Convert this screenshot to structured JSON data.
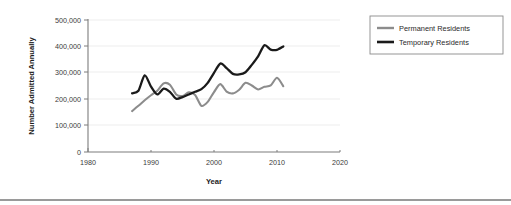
{
  "chart_data": {
    "type": "line",
    "title": "",
    "xlabel": "Year",
    "ylabel": "Number Admitted Annually",
    "xlim": [
      1980,
      2020
    ],
    "ylim": [
      0,
      500000
    ],
    "grid": true,
    "legend_position": "right",
    "x_ticks": [
      "1980",
      "1990",
      "2000",
      "2010",
      "2020"
    ],
    "x_tick_values": [
      1980,
      1990,
      2000,
      2010,
      2020
    ],
    "y_ticks": [
      "0",
      "100,000",
      "200,000",
      "300,000",
      "400,000",
      "500,000"
    ],
    "y_tick_values": [
      0,
      100000,
      200000,
      300000,
      400000,
      500000
    ],
    "x": [
      1987,
      1988,
      1989,
      1990,
      1991,
      1992,
      1993,
      1994,
      1995,
      1996,
      1997,
      1998,
      1999,
      2000,
      2001,
      2002,
      2003,
      2004,
      2005,
      2006,
      2007,
      2008,
      2009,
      2010,
      2011
    ],
    "series": [
      {
        "name": "Permanent Residents",
        "color": "#8c8c8c",
        "values": [
          155000,
          175000,
          196000,
          215000,
          232000,
          260000,
          255000,
          218000,
          212000,
          226000,
          216000,
          175000,
          190000,
          227000,
          257000,
          229000,
          222000,
          236000,
          262000,
          252000,
          237000,
          247000,
          252000,
          281000,
          249000
        ]
      },
      {
        "name": "Temporary Residents",
        "color": "#1a1a1a",
        "values": [
          222000,
          232000,
          290000,
          248000,
          218000,
          240000,
          228000,
          202000,
          208000,
          218000,
          228000,
          238000,
          262000,
          300000,
          335000,
          318000,
          296000,
          294000,
          302000,
          330000,
          362000,
          404000,
          388000,
          387000,
          400000
        ]
      }
    ]
  },
  "legend": {
    "items": [
      {
        "label": "Permanent Residents"
      },
      {
        "label": "Temporary Residents"
      }
    ]
  }
}
